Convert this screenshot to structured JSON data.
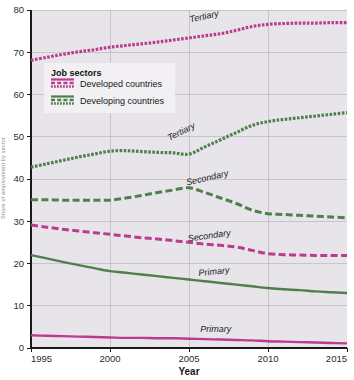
{
  "chart_data": {
    "type": "line",
    "title": "",
    "xlabel": "Year",
    "ylabel": "Share of employment by sector",
    "xlim": [
      1995,
      2015
    ],
    "ylim": [
      0,
      80
    ],
    "grid": true,
    "xticks": [
      "1995",
      "2000",
      "2005",
      "2010",
      "2015"
    ],
    "yticks": [
      "0",
      "10",
      "20",
      "30",
      "40",
      "50",
      "60",
      "70",
      "80"
    ],
    "x": [
      1995,
      1996,
      1997,
      1998,
      1999,
      2000,
      2001,
      2002,
      2003,
      2004,
      2005,
      2006,
      2007,
      2008,
      2009,
      2010,
      2011,
      2012,
      2013,
      2014,
      2015
    ],
    "legend": {
      "title": "Job sectors",
      "position": "upper-left-inside",
      "entries": [
        {
          "label": "Developed countries",
          "color": "#bb3b90",
          "swatch": "three-line-styles"
        },
        {
          "label": "Developing countries",
          "color": "#4f7f4a",
          "swatch": "three-line-styles"
        }
      ]
    },
    "series": [
      {
        "name": "Tertiary",
        "group": "Developed countries",
        "color": "#bb3b90",
        "style": "dotted",
        "annotation": "Tertiary",
        "values": [
          68.1,
          68.8,
          69.5,
          70.1,
          70.6,
          71.2,
          71.6,
          72.0,
          72.4,
          72.9,
          73.4,
          73.9,
          74.4,
          75.2,
          76.1,
          76.6,
          76.8,
          76.9,
          76.9,
          77.0,
          77.0
        ]
      },
      {
        "name": "Secondary",
        "group": "Developed countries",
        "color": "#bb3b90",
        "style": "dashed",
        "annotation": "Secondary",
        "values": [
          29.1,
          28.6,
          28.1,
          27.7,
          27.3,
          26.9,
          26.5,
          26.1,
          25.8,
          25.4,
          25.0,
          24.6,
          24.3,
          23.9,
          23.1,
          22.3,
          22.1,
          22.0,
          21.9,
          21.9,
          21.9
        ]
      },
      {
        "name": "Primary",
        "group": "Developed countries",
        "color": "#bb3b90",
        "style": "solid",
        "annotation": "Primary",
        "values": [
          3.0,
          2.9,
          2.8,
          2.7,
          2.6,
          2.5,
          2.4,
          2.4,
          2.3,
          2.3,
          2.2,
          2.1,
          2.0,
          1.9,
          1.8,
          1.6,
          1.5,
          1.4,
          1.3,
          1.2,
          1.1
        ]
      },
      {
        "name": "Tertiary",
        "group": "Developing countries",
        "color": "#4f7f4a",
        "style": "dotted",
        "annotation": "Tertiary",
        "values": [
          42.8,
          43.6,
          44.4,
          45.2,
          45.9,
          46.6,
          46.7,
          46.5,
          46.3,
          46.2,
          45.9,
          47.6,
          49.3,
          51.0,
          52.7,
          53.6,
          54.1,
          54.5,
          54.9,
          55.3,
          55.7
        ]
      },
      {
        "name": "Secondary",
        "group": "Developing countries",
        "color": "#4f7f4a",
        "style": "dashed",
        "annotation": "Secondary",
        "values": [
          35.1,
          35.1,
          35.0,
          35.0,
          35.0,
          35.0,
          35.5,
          36.1,
          36.8,
          37.4,
          37.9,
          36.8,
          35.5,
          34.2,
          32.6,
          31.8,
          31.6,
          31.4,
          31.2,
          31.0,
          30.8
        ]
      },
      {
        "name": "Primary",
        "group": "Developing countries",
        "color": "#4f7f4a",
        "style": "solid",
        "annotation": "Primary",
        "values": [
          22.0,
          21.2,
          20.4,
          19.6,
          18.9,
          18.2,
          17.8,
          17.4,
          17.0,
          16.6,
          16.2,
          15.8,
          15.4,
          15.0,
          14.6,
          14.2,
          13.9,
          13.7,
          13.4,
          13.2,
          13.0
        ]
      }
    ],
    "annotations": [
      {
        "text": "Tertiary",
        "x": 2006.0,
        "y": 77.8,
        "rotate": -13,
        "color": "#232323"
      },
      {
        "text": "Tertiary",
        "x": 2004.6,
        "y": 50.6,
        "rotate": -27,
        "color": "#232323"
      },
      {
        "text": "Secondary",
        "x": 2006.2,
        "y": 39.6,
        "rotate": -13,
        "color": "#232323"
      },
      {
        "text": "Secondary",
        "x": 2006.3,
        "y": 25.9,
        "rotate": -8,
        "color": "#232323"
      },
      {
        "text": "Primary",
        "x": 2006.6,
        "y": 17.4,
        "rotate": -6,
        "color": "#232323"
      },
      {
        "text": "Primary",
        "x": 2006.7,
        "y": 3.9,
        "rotate": 0,
        "color": "#232323"
      }
    ],
    "colors": {
      "plot_background": "#e7e5e9",
      "page_background": "#ffffff",
      "gridline": "#b9b7bd",
      "axis": "#1a1a1a",
      "developed": "#bb3b90",
      "developing": "#4f7f4a",
      "legend_background": "#f2f0f3"
    }
  }
}
